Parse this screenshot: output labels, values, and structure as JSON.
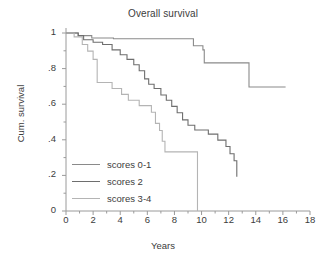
{
  "chart_data": {
    "type": "line",
    "subtype": "kaplan-meier-step",
    "title": "Overall survival",
    "xlabel": "Years",
    "ylabel": "Cum. survival",
    "xlim": [
      0,
      18
    ],
    "ylim": [
      0,
      1
    ],
    "xticks": [
      0,
      2,
      4,
      6,
      8,
      10,
      12,
      14,
      16,
      18
    ],
    "xticklabels": [
      "0",
      "2",
      "4",
      "6",
      "8",
      "10",
      "12",
      "14",
      "16",
      "18"
    ],
    "yticks": [
      0,
      0.2,
      0.4,
      0.6,
      0.8,
      1
    ],
    "yticklabels": [
      "0",
      ".2",
      ".4",
      ".6",
      ".8",
      "1"
    ],
    "minor_ticks": true,
    "grid": false,
    "legend_position": "lower-left-inside",
    "series": [
      {
        "name": "scores 0-1",
        "color": "#8a8a8a",
        "points": [
          [
            0.0,
            1.0
          ],
          [
            0.6,
            1.0
          ],
          [
            0.9,
            0.985
          ],
          [
            1.6,
            0.985
          ],
          [
            1.9,
            0.972
          ],
          [
            3.4,
            0.972
          ],
          [
            3.5,
            0.968
          ],
          [
            9.3,
            0.968
          ],
          [
            9.4,
            0.928
          ],
          [
            10.0,
            0.928
          ],
          [
            10.1,
            0.905
          ],
          [
            10.2,
            0.832
          ],
          [
            13.4,
            0.832
          ],
          [
            13.5,
            0.697
          ],
          [
            16.2,
            0.697
          ]
        ]
      },
      {
        "name": "scores 2",
        "color": "#6e6e6e",
        "points": [
          [
            0.0,
            1.0
          ],
          [
            0.8,
            1.0
          ],
          [
            0.9,
            0.985
          ],
          [
            1.2,
            0.985
          ],
          [
            1.3,
            0.962
          ],
          [
            1.9,
            0.962
          ],
          [
            2.0,
            0.948
          ],
          [
            2.6,
            0.948
          ],
          [
            2.7,
            0.935
          ],
          [
            3.3,
            0.935
          ],
          [
            3.4,
            0.905
          ],
          [
            3.9,
            0.905
          ],
          [
            4.0,
            0.878
          ],
          [
            4.4,
            0.878
          ],
          [
            4.5,
            0.852
          ],
          [
            4.9,
            0.852
          ],
          [
            5.0,
            0.822
          ],
          [
            5.3,
            0.822
          ],
          [
            5.4,
            0.788
          ],
          [
            5.7,
            0.788
          ],
          [
            5.8,
            0.742
          ],
          [
            6.0,
            0.742
          ],
          [
            6.1,
            0.712
          ],
          [
            6.4,
            0.712
          ],
          [
            6.5,
            0.688
          ],
          [
            6.9,
            0.688
          ],
          [
            7.0,
            0.652
          ],
          [
            7.3,
            0.652
          ],
          [
            7.4,
            0.622
          ],
          [
            7.7,
            0.622
          ],
          [
            7.8,
            0.588
          ],
          [
            8.1,
            0.588
          ],
          [
            8.2,
            0.552
          ],
          [
            8.5,
            0.552
          ],
          [
            8.6,
            0.512
          ],
          [
            8.9,
            0.512
          ],
          [
            9.0,
            0.482
          ],
          [
            9.4,
            0.482
          ],
          [
            9.5,
            0.455
          ],
          [
            10.4,
            0.455
          ],
          [
            10.5,
            0.432
          ],
          [
            11.1,
            0.432
          ],
          [
            11.2,
            0.398
          ],
          [
            11.7,
            0.398
          ],
          [
            11.8,
            0.362
          ],
          [
            12.0,
            0.362
          ],
          [
            12.1,
            0.322
          ],
          [
            12.3,
            0.322
          ],
          [
            12.4,
            0.282
          ],
          [
            12.5,
            0.282
          ],
          [
            12.6,
            0.192
          ]
        ]
      },
      {
        "name": "scores 3-4",
        "color": "#b4b4b4",
        "points": [
          [
            0.0,
            1.0
          ],
          [
            0.5,
            1.0
          ],
          [
            0.6,
            0.978
          ],
          [
            1.1,
            0.978
          ],
          [
            1.2,
            0.935
          ],
          [
            1.5,
            0.935
          ],
          [
            1.6,
            0.898
          ],
          [
            1.9,
            0.898
          ],
          [
            2.0,
            0.852
          ],
          [
            2.2,
            0.852
          ],
          [
            2.3,
            0.722
          ],
          [
            3.3,
            0.722
          ],
          [
            3.4,
            0.688
          ],
          [
            4.0,
            0.688
          ],
          [
            4.1,
            0.655
          ],
          [
            4.5,
            0.655
          ],
          [
            4.6,
            0.622
          ],
          [
            5.3,
            0.622
          ],
          [
            5.4,
            0.592
          ],
          [
            6.2,
            0.592
          ],
          [
            6.3,
            0.555
          ],
          [
            6.5,
            0.555
          ],
          [
            6.6,
            0.492
          ],
          [
            6.8,
            0.492
          ],
          [
            6.9,
            0.452
          ],
          [
            7.0,
            0.452
          ],
          [
            7.1,
            0.392
          ],
          [
            7.2,
            0.392
          ],
          [
            7.3,
            0.332
          ],
          [
            9.6,
            0.332
          ],
          [
            9.7,
            0.0
          ]
        ]
      }
    ]
  },
  "legend": {
    "items": [
      {
        "label": "scores 0-1",
        "color": "#8a8a8a"
      },
      {
        "label": "scores 2",
        "color": "#6e6e6e"
      },
      {
        "label": "scores 3-4",
        "color": "#b4b4b4"
      }
    ]
  },
  "axis": {
    "spine_color": "#9a9a9a"
  }
}
